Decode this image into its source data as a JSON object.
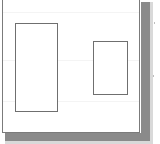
{
  "document": {
    "kind": "scanned-page",
    "page_background_color": "#ffffff",
    "page_border_color": "#7b7b7b",
    "shadow_color": "#8a8a8a",
    "soft_shadow_color": "#d9d9d9",
    "caption": "",
    "visible_text": ""
  },
  "shapes": {
    "stroke_color": "#6f6f6f",
    "fill_color": "#ffffff",
    "items": [
      {
        "name": "large-rectangle",
        "label": "",
        "x": 15,
        "y": 22,
        "width": 43,
        "height": 89,
        "orientation": "portrait"
      },
      {
        "name": "small-rectangle",
        "label": "",
        "x": 93,
        "y": 40,
        "width": 35,
        "height": 54,
        "orientation": "portrait"
      }
    ]
  },
  "margin_marks": {
    "color": "#bdbdbd",
    "items": [
      {
        "name": "speck-upper",
        "x": 154,
        "y": 22
      },
      {
        "name": "speck-lower",
        "x": 153,
        "y": 75
      }
    ]
  },
  "scan_bands": {
    "color": "#f4f4f4",
    "rows": [
      14,
      62,
      103
    ]
  }
}
